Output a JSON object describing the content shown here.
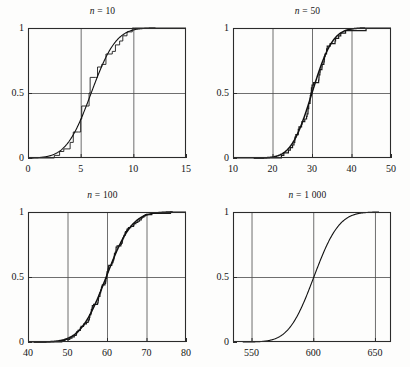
{
  "figure": {
    "kind": "four-panel-cdf-convergence",
    "background_color": "#fdfdfc",
    "frame_color": "#2b2b2b",
    "grid_color": "#4a4a4a",
    "curve_color": "#111111",
    "step_color": "#1c1c1c",
    "text_color": "#141414"
  },
  "panels": [
    {
      "id": "panel-n-10",
      "title_var": "n",
      "title_rest": " = 10",
      "title_full": "n = 10",
      "n": 10,
      "xlim": [
        0,
        15
      ],
      "ylim": [
        0,
        1
      ],
      "xticks": [
        0,
        5,
        10,
        15
      ],
      "xticklabels": [
        "0",
        "5",
        "10",
        "15"
      ],
      "gridlines_x": [
        5,
        10
      ],
      "yticks": [
        0,
        0.5,
        1
      ],
      "yticklabels": [
        "0",
        "0.5",
        "1"
      ],
      "gridlines_y": [
        0.5
      ],
      "grid": true,
      "has_step": true,
      "mean": 6.0,
      "sd": 1.85,
      "step_points": [
        [
          1.9,
          0.0
        ],
        [
          2.5,
          0.02
        ],
        [
          3.0,
          0.05
        ],
        [
          3.4,
          0.07
        ],
        [
          4.0,
          0.12
        ],
        [
          4.3,
          0.2
        ],
        [
          4.8,
          0.2
        ],
        [
          5.0,
          0.3
        ],
        [
          5.1,
          0.4
        ],
        [
          5.6,
          0.4
        ],
        [
          5.8,
          0.5
        ],
        [
          5.9,
          0.62
        ],
        [
          6.4,
          0.62
        ],
        [
          6.6,
          0.7
        ],
        [
          7.0,
          0.72
        ],
        [
          7.4,
          0.8
        ],
        [
          8.0,
          0.82
        ],
        [
          8.3,
          0.87
        ],
        [
          8.7,
          0.9
        ],
        [
          9.0,
          0.94
        ],
        [
          9.4,
          0.97
        ],
        [
          9.9,
          1.0
        ],
        [
          10.1,
          1.0
        ]
      ]
    },
    {
      "id": "panel-n-50",
      "title_var": "n",
      "title_rest": " = 50",
      "title_full": "n = 50",
      "n": 50,
      "xlim": [
        10,
        50
      ],
      "ylim": [
        0,
        1
      ],
      "xticks": [
        10,
        20,
        30,
        40,
        50
      ],
      "xticklabels": [
        "10",
        "20",
        "30",
        "40",
        "50"
      ],
      "gridlines_x": [
        20,
        30,
        40
      ],
      "yticks": [
        0,
        0.5,
        1
      ],
      "yticklabels": [
        "0",
        "0.5",
        "1"
      ],
      "gridlines_y": [
        0.5
      ],
      "grid": true,
      "has_step": true,
      "mean": 30.0,
      "sd": 4.1,
      "step_points": []
    },
    {
      "id": "panel-n-100",
      "title_var": "n",
      "title_rest": " = 100",
      "title_full": "n = 100",
      "n": 100,
      "xlim": [
        40,
        80
      ],
      "ylim": [
        0,
        1
      ],
      "xticks": [
        40,
        50,
        60,
        70,
        80
      ],
      "xticklabels": [
        "40",
        "50",
        "60",
        "70",
        "80"
      ],
      "gridlines_x": [
        50,
        60,
        70
      ],
      "yticks": [
        0,
        0.5,
        1
      ],
      "yticklabels": [
        "0",
        "0.5",
        "1"
      ],
      "gridlines_y": [
        0.5
      ],
      "grid": true,
      "has_step": true,
      "mean": 59.8,
      "sd": 5.1,
      "step_points": []
    },
    {
      "id": "panel-n-1000",
      "title_var": "n",
      "title_rest": " = 1 000",
      "title_full": "n = 1 000",
      "n": 1000,
      "xlim": [
        535,
        663
      ],
      "ylim": [
        0,
        1
      ],
      "xticks": [
        550,
        600,
        650
      ],
      "xticklabels": [
        "550",
        "600",
        "650"
      ],
      "gridlines_x": [
        550,
        600,
        650
      ],
      "yticks": [
        0,
        0.5,
        1
      ],
      "yticklabels": [
        "0",
        "0.5",
        "1"
      ],
      "gridlines_y": [
        0.5
      ],
      "grid": true,
      "has_step": false,
      "mean": 600.5,
      "sd": 16.0,
      "step_points": []
    }
  ],
  "chart_data": {
    "type": "line",
    "xlabel": "",
    "ylabel": "",
    "grid": true,
    "legend_position": "none",
    "panel_layout": "2x2",
    "shared_ylim": [
      0,
      1
    ],
    "shared_yticks": [
      0,
      0.5,
      1
    ],
    "subplots": [
      {
        "title": "n = 10",
        "n": 10,
        "xlim": [
          0,
          15
        ],
        "xticks": [
          0,
          5,
          10,
          15
        ],
        "series": [
          {
            "name": "empirical CDF (step)",
            "x": [
              1.9,
              2.5,
              3.0,
              3.4,
              4.0,
              4.3,
              4.8,
              5.0,
              5.1,
              5.6,
              5.8,
              5.9,
              6.4,
              6.6,
              7.0,
              7.4,
              8.0,
              8.3,
              8.7,
              9.0,
              9.4,
              9.9
            ],
            "values": [
              0.0,
              0.02,
              0.05,
              0.07,
              0.12,
              0.2,
              0.2,
              0.3,
              0.4,
              0.4,
              0.5,
              0.62,
              0.62,
              0.7,
              0.72,
              0.8,
              0.82,
              0.87,
              0.9,
              0.94,
              0.97,
              1.0
            ]
          },
          {
            "name": "normal CDF",
            "mean": 6.0,
            "sd": 1.85,
            "x": [
              1.5,
              2.5,
              3.5,
              4.5,
              5.0,
              5.5,
              6.0,
              6.5,
              7.0,
              7.5,
              8.5,
              9.5,
              10.0
            ],
            "values": [
              0.005,
              0.03,
              0.1,
              0.21,
              0.3,
              0.39,
              0.5,
              0.61,
              0.7,
              0.79,
              0.91,
              0.97,
              0.985
            ]
          }
        ]
      },
      {
        "title": "n = 50",
        "n": 50,
        "xlim": [
          10,
          50
        ],
        "xticks": [
          10,
          20,
          30,
          40,
          50
        ],
        "series": [
          {
            "name": "normal CDF",
            "mean": 30.0,
            "sd": 4.1,
            "x": [
              20,
              22,
              24,
              26,
              28,
              30,
              32,
              34,
              36,
              38,
              40
            ],
            "values": [
              0.007,
              0.026,
              0.072,
              0.164,
              0.313,
              0.5,
              0.687,
              0.836,
              0.928,
              0.974,
              0.993
            ]
          }
        ]
      },
      {
        "title": "n = 100",
        "n": 100,
        "xlim": [
          40,
          80
        ],
        "xticks": [
          40,
          50,
          60,
          70,
          80
        ],
        "series": [
          {
            "name": "normal CDF",
            "mean": 59.8,
            "sd": 5.1,
            "x": [
              46,
              48,
              50,
              52,
              54,
              56,
              58,
              60,
              62,
              64,
              66,
              68,
              70,
              72
            ],
            "values": [
              0.005,
              0.012,
              0.029,
              0.06,
              0.122,
              0.218,
              0.354,
              0.516,
              0.673,
              0.802,
              0.895,
              0.95,
              0.979,
              0.992
            ]
          }
        ]
      },
      {
        "title": "n = 1 000",
        "n": 1000,
        "xlim": [
          535,
          663
        ],
        "xticks": [
          550,
          600,
          650
        ],
        "series": [
          {
            "name": "normal CDF",
            "mean": 600.5,
            "sd": 16.0,
            "x": [
              560,
              568,
              576,
              584,
              592,
              600,
              608,
              616,
              624,
              632,
              640
            ],
            "values": [
              0.007,
              0.021,
              0.063,
              0.151,
              0.3,
              0.488,
              0.68,
              0.835,
              0.929,
              0.976,
              0.993
            ]
          }
        ]
      }
    ]
  }
}
